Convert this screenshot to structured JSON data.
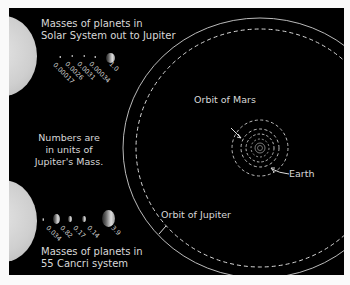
{
  "solar_system": {
    "title_line1": "Masses of planets in",
    "title_line2": "Solar System out to Jupiter",
    "masses": [
      "0.00017",
      "0.0026",
      "0.0031",
      "0.00034",
      "1.0"
    ]
  },
  "note": {
    "line1": "Numbers are",
    "line2": "in units of",
    "line3": "Jupiter's Mass."
  },
  "cancri": {
    "title_line1": "Masses of planets in",
    "title_line2": "55 Cancri system",
    "masses": [
      "0.034",
      "0.82",
      "0.17",
      "0.14",
      "3.9"
    ]
  },
  "orbits": {
    "mars_label": "Orbit of Mars",
    "earth_label": "Earth",
    "jupiter_label": "Orbit of Jupiter"
  }
}
